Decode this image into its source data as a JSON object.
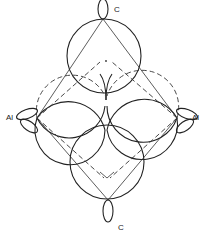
{
  "diagram": {
    "type": "molecular orbital / lobe diagram",
    "atoms": [
      {
        "id": "c_top",
        "label": "C",
        "x": 103,
        "y": 18
      },
      {
        "id": "al_left",
        "label": "Al",
        "x": 37,
        "y": 118
      },
      {
        "id": "al_right",
        "label": "Al",
        "x": 177,
        "y": 118
      },
      {
        "id": "c_bottom",
        "label": "C",
        "x": 108,
        "y": 203
      }
    ],
    "labels": {
      "c_top": "C",
      "al_left": "Al",
      "al_right": "Al",
      "c_bottom": "C"
    },
    "colors": {
      "line": "#222222",
      "background": "#ffffff"
    }
  }
}
